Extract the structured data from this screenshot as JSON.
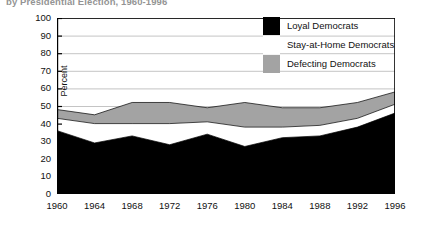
{
  "chart_data": {
    "type": "area",
    "title": "by Presidential Election, 1960-1996",
    "xlabel": "",
    "ylabel": "Percent",
    "ylim": [
      0,
      100
    ],
    "ytick_step": 10,
    "grid": true,
    "legend_position": "top-right",
    "stacked": true,
    "categories": [
      1960,
      1964,
      1968,
      1972,
      1976,
      1980,
      1984,
      1988,
      1992,
      1996
    ],
    "xtick_labels": [
      "1960",
      "1964",
      "1968",
      "1972",
      "1976",
      "1980",
      "1984",
      "1988",
      "1992",
      "1996"
    ],
    "ytick_labels": [
      "0",
      "10",
      "20",
      "30",
      "40",
      "50",
      "60",
      "70",
      "80",
      "90",
      "100"
    ],
    "series": [
      {
        "name": "Loyal Democrats",
        "color": "#000000",
        "values": [
          36,
          29,
          33,
          28,
          34,
          27,
          32,
          33,
          38,
          46
        ]
      },
      {
        "name": "Stay-at-Home Democrats",
        "color": "#ffffff",
        "values": [
          7,
          11,
          7,
          12,
          7,
          11,
          6,
          6,
          5,
          5
        ]
      },
      {
        "name": "Defecting Democrats",
        "color": "#a3a3a3",
        "values": [
          5,
          5,
          12,
          12,
          8,
          14,
          11,
          10,
          9,
          7
        ]
      }
    ],
    "cumulative": {
      "loyal_top": [
        36,
        29,
        33,
        28,
        34,
        27,
        32,
        33,
        38,
        46
      ],
      "stay_home_top": [
        43,
        40,
        40,
        40,
        41,
        38,
        38,
        39,
        43,
        51
      ],
      "defecting_top": [
        48,
        45,
        52,
        52,
        49,
        52,
        49,
        49,
        52,
        58
      ]
    }
  },
  "legend": {
    "items": [
      {
        "label": "Loyal Democrats",
        "swatch": "black"
      },
      {
        "label": "Stay-at-Home Democrats",
        "swatch": "white"
      },
      {
        "label": "Defecting Democrats",
        "swatch": "gray"
      }
    ]
  },
  "colors": {
    "loyal": "#000000",
    "stay_at_home": "#ffffff",
    "defecting": "#a3a3a3",
    "axis": "#000000",
    "grid": "#b5b5b5",
    "text": "#111111"
  }
}
